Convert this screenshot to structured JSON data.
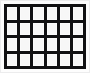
{
  "icon": {
    "name": "table-grid-icon",
    "label": "Grid",
    "colors": {
      "page_background": "#ffffff",
      "canvas_background": "#fdfdfd",
      "canvas_border": "#ececed",
      "grid_line": "#111113",
      "cell_fill": "#f7f7f7"
    },
    "grid": {
      "columns": 6,
      "rows": 4,
      "cell_count": 24,
      "line_width_px": 3,
      "frame_width_px": 3
    },
    "cells": [
      {
        "row": 1,
        "col": 1,
        "value": ""
      },
      {
        "row": 1,
        "col": 2,
        "value": ""
      },
      {
        "row": 1,
        "col": 3,
        "value": ""
      },
      {
        "row": 1,
        "col": 4,
        "value": ""
      },
      {
        "row": 1,
        "col": 5,
        "value": ""
      },
      {
        "row": 1,
        "col": 6,
        "value": ""
      },
      {
        "row": 2,
        "col": 1,
        "value": ""
      },
      {
        "row": 2,
        "col": 2,
        "value": ""
      },
      {
        "row": 2,
        "col": 3,
        "value": ""
      },
      {
        "row": 2,
        "col": 4,
        "value": ""
      },
      {
        "row": 2,
        "col": 5,
        "value": ""
      },
      {
        "row": 2,
        "col": 6,
        "value": ""
      },
      {
        "row": 3,
        "col": 1,
        "value": ""
      },
      {
        "row": 3,
        "col": 2,
        "value": ""
      },
      {
        "row": 3,
        "col": 3,
        "value": ""
      },
      {
        "row": 3,
        "col": 4,
        "value": ""
      },
      {
        "row": 3,
        "col": 5,
        "value": ""
      },
      {
        "row": 3,
        "col": 6,
        "value": ""
      },
      {
        "row": 4,
        "col": 1,
        "value": ""
      },
      {
        "row": 4,
        "col": 2,
        "value": ""
      },
      {
        "row": 4,
        "col": 3,
        "value": ""
      },
      {
        "row": 4,
        "col": 4,
        "value": ""
      },
      {
        "row": 4,
        "col": 5,
        "value": ""
      },
      {
        "row": 4,
        "col": 6,
        "value": ""
      }
    ]
  }
}
